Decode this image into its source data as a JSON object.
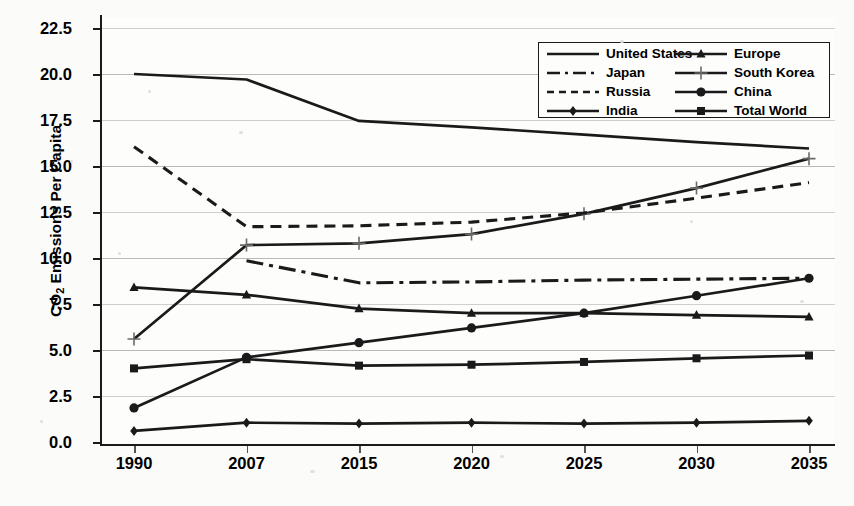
{
  "chart_data": {
    "type": "line",
    "title": "",
    "xlabel": "",
    "ylabel": "CO2 Emissions Per Capita",
    "ylabel_rich": {
      "prefix": "CO",
      "sub": "2",
      "suffix": " Emissions Per Capita"
    },
    "categories": [
      "1990",
      "2007",
      "2015",
      "2020",
      "2025",
      "2030",
      "2035"
    ],
    "yticks": [
      "0.0",
      "2.5",
      "5.0",
      "7.5",
      "10.0",
      "12.5",
      "15.0",
      "17.5",
      "20.0",
      "22.5"
    ],
    "ylim": [
      0,
      22.5
    ],
    "grid": true,
    "legend_position": "top-right",
    "legend_columns": 2,
    "series": [
      {
        "name": "United States",
        "style": "solid",
        "marker": "none",
        "values": [
          20.0,
          19.7,
          17.45,
          17.1,
          16.7,
          16.3,
          15.95
        ]
      },
      {
        "name": "Europe",
        "style": "solid",
        "marker": "triangle",
        "values": [
          8.4,
          8.0,
          7.25,
          7.0,
          7.0,
          6.9,
          6.8
        ]
      },
      {
        "name": "Japan",
        "style": "dashdot",
        "marker": "none",
        "values": [
          null,
          9.85,
          8.65,
          8.7,
          8.8,
          8.85,
          8.9
        ]
      },
      {
        "name": "South Korea",
        "style": "solid",
        "marker": "plus",
        "values": [
          5.6,
          10.7,
          10.8,
          11.3,
          12.4,
          13.8,
          15.4
        ]
      },
      {
        "name": "Russia",
        "style": "dashed",
        "marker": "none",
        "values": [
          16.05,
          11.7,
          11.75,
          11.95,
          12.45,
          13.25,
          14.1
        ]
      },
      {
        "name": "China",
        "style": "solid",
        "marker": "circle",
        "values": [
          1.85,
          4.6,
          5.4,
          6.2,
          7.0,
          7.95,
          8.9
        ]
      },
      {
        "name": "India",
        "style": "solid",
        "marker": "diamond",
        "values": [
          0.6,
          1.05,
          1.0,
          1.05,
          1.0,
          1.05,
          1.15
        ]
      },
      {
        "name": "Total World",
        "style": "solid",
        "marker": "square",
        "values": [
          4.0,
          4.5,
          4.15,
          4.2,
          4.35,
          4.55,
          4.7
        ]
      }
    ]
  },
  "legend": {
    "entries": [
      {
        "label": "United States",
        "style": "solid",
        "marker": "none"
      },
      {
        "label": "Europe",
        "style": "solid",
        "marker": "triangle"
      },
      {
        "label": "Japan",
        "style": "dashdot",
        "marker": "none"
      },
      {
        "label": "South Korea",
        "style": "solid",
        "marker": "plus"
      },
      {
        "label": "Russia",
        "style": "dashed",
        "marker": "none"
      },
      {
        "label": "China",
        "style": "solid",
        "marker": "circle"
      },
      {
        "label": "India",
        "style": "solid",
        "marker": "diamond"
      },
      {
        "label": "Total World",
        "style": "solid",
        "marker": "square"
      }
    ]
  },
  "colors": {
    "ink": "#1a1a1a",
    "grid": "#b9b9b9",
    "background": "#fbfbfa"
  }
}
